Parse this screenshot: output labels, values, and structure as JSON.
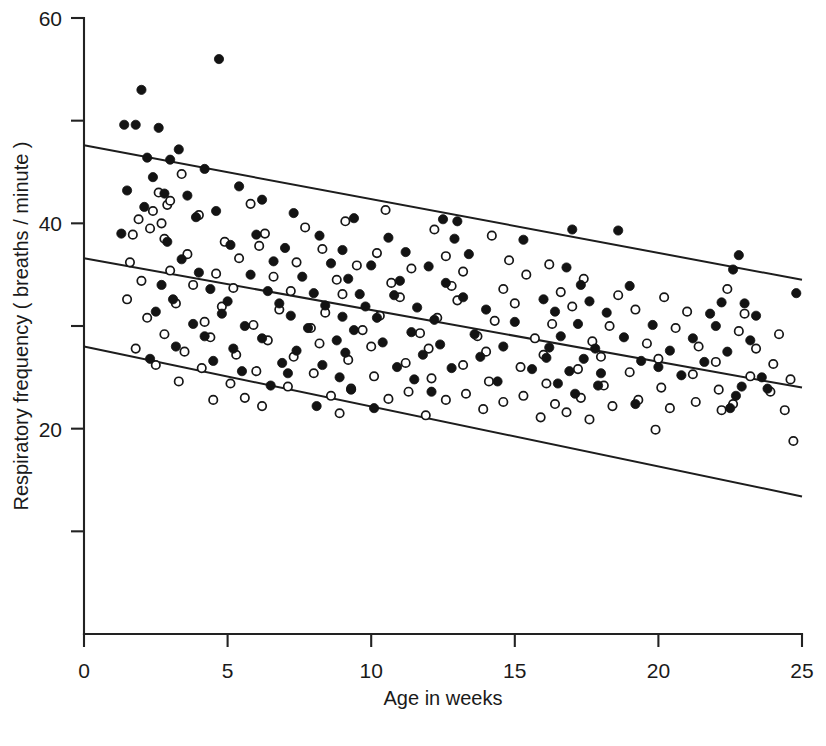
{
  "chart_data": {
    "type": "scatter",
    "title": "",
    "xlabel": "Age in weeks",
    "ylabel": "Respiratory frequency ( breaths / minute )",
    "xlim": [
      0,
      25
    ],
    "ylim": [
      0,
      60
    ],
    "grid": false,
    "legend_position": "none",
    "x_ticks": [
      0,
      5,
      10,
      15,
      20,
      25
    ],
    "x_tick_labels": [
      "0",
      "5",
      "10",
      "15",
      "20",
      "25"
    ],
    "y_ticks": [
      20,
      40,
      60
    ],
    "y_tick_labels": [
      "20",
      "40",
      "60"
    ],
    "y_minor_ticks": [
      10,
      30,
      50
    ],
    "series": [
      {
        "name": "filled-circles",
        "marker": "filled circle",
        "color": "#131313",
        "points": [
          [
            4.7,
            56.0
          ],
          [
            2.0,
            53.0
          ],
          [
            1.4,
            49.6
          ],
          [
            1.8,
            49.6
          ],
          [
            2.6,
            49.3
          ],
          [
            3.3,
            47.2
          ],
          [
            2.2,
            46.4
          ],
          [
            3.0,
            46.2
          ],
          [
            4.2,
            45.3
          ],
          [
            2.4,
            44.5
          ],
          [
            5.4,
            43.6
          ],
          [
            1.5,
            43.2
          ],
          [
            2.8,
            42.9
          ],
          [
            3.6,
            42.7
          ],
          [
            6.2,
            42.3
          ],
          [
            2.1,
            41.6
          ],
          [
            4.6,
            41.2
          ],
          [
            7.3,
            41.0
          ],
          [
            3.9,
            40.6
          ],
          [
            9.4,
            40.5
          ],
          [
            12.5,
            40.4
          ],
          [
            13.0,
            40.2
          ],
          [
            17.0,
            39.4
          ],
          [
            18.6,
            39.3
          ],
          [
            1.3,
            39.0
          ],
          [
            6.0,
            38.9
          ],
          [
            8.2,
            38.8
          ],
          [
            10.6,
            38.6
          ],
          [
            12.9,
            38.5
          ],
          [
            15.3,
            38.4
          ],
          [
            2.9,
            38.2
          ],
          [
            5.1,
            37.9
          ],
          [
            7.0,
            37.6
          ],
          [
            9.0,
            37.4
          ],
          [
            11.2,
            37.2
          ],
          [
            13.4,
            37.0
          ],
          [
            22.8,
            36.9
          ],
          [
            3.4,
            36.5
          ],
          [
            6.6,
            36.3
          ],
          [
            8.6,
            36.1
          ],
          [
            10.0,
            35.9
          ],
          [
            12.0,
            35.8
          ],
          [
            16.8,
            35.7
          ],
          [
            22.6,
            35.5
          ],
          [
            24.8,
            33.2
          ],
          [
            4.0,
            35.2
          ],
          [
            5.8,
            35.0
          ],
          [
            7.6,
            34.8
          ],
          [
            9.2,
            34.6
          ],
          [
            11.0,
            34.4
          ],
          [
            12.6,
            34.2
          ],
          [
            17.3,
            34.0
          ],
          [
            19.0,
            33.9
          ],
          [
            2.7,
            34.0
          ],
          [
            4.4,
            33.6
          ],
          [
            6.4,
            33.4
          ],
          [
            8.0,
            33.2
          ],
          [
            9.6,
            33.1
          ],
          [
            10.8,
            33.0
          ],
          [
            13.2,
            32.8
          ],
          [
            16.0,
            32.6
          ],
          [
            17.6,
            32.4
          ],
          [
            22.2,
            32.3
          ],
          [
            23.0,
            32.2
          ],
          [
            3.1,
            32.6
          ],
          [
            5.0,
            32.4
          ],
          [
            6.8,
            32.2
          ],
          [
            8.4,
            32.0
          ],
          [
            9.8,
            31.9
          ],
          [
            11.6,
            31.8
          ],
          [
            14.0,
            31.6
          ],
          [
            16.4,
            31.4
          ],
          [
            18.2,
            31.3
          ],
          [
            21.8,
            31.2
          ],
          [
            23.4,
            31.0
          ],
          [
            2.5,
            31.4
          ],
          [
            4.8,
            31.2
          ],
          [
            7.2,
            31.0
          ],
          [
            9.0,
            30.9
          ],
          [
            10.2,
            30.8
          ],
          [
            12.2,
            30.6
          ],
          [
            15.0,
            30.4
          ],
          [
            17.2,
            30.2
          ],
          [
            19.8,
            30.1
          ],
          [
            22.0,
            30.0
          ],
          [
            3.8,
            30.2
          ],
          [
            5.6,
            30.0
          ],
          [
            7.8,
            29.8
          ],
          [
            9.4,
            29.6
          ],
          [
            11.4,
            29.4
          ],
          [
            13.6,
            29.2
          ],
          [
            16.6,
            29.0
          ],
          [
            18.8,
            28.9
          ],
          [
            21.2,
            28.8
          ],
          [
            23.2,
            28.6
          ],
          [
            4.2,
            29.0
          ],
          [
            6.2,
            28.8
          ],
          [
            8.8,
            28.6
          ],
          [
            10.4,
            28.4
          ],
          [
            12.4,
            28.2
          ],
          [
            14.6,
            28.0
          ],
          [
            16.2,
            27.9
          ],
          [
            17.8,
            27.8
          ],
          [
            20.4,
            27.6
          ],
          [
            22.4,
            27.5
          ],
          [
            3.2,
            28.0
          ],
          [
            5.2,
            27.8
          ],
          [
            7.4,
            27.6
          ],
          [
            9.1,
            27.4
          ],
          [
            11.8,
            27.2
          ],
          [
            13.8,
            27.0
          ],
          [
            16.1,
            26.9
          ],
          [
            17.4,
            26.8
          ],
          [
            19.4,
            26.6
          ],
          [
            21.6,
            26.5
          ],
          [
            4.5,
            26.6
          ],
          [
            6.9,
            26.4
          ],
          [
            8.3,
            26.2
          ],
          [
            10.9,
            26.0
          ],
          [
            12.8,
            25.9
          ],
          [
            15.6,
            25.8
          ],
          [
            16.9,
            25.6
          ],
          [
            18.0,
            25.4
          ],
          [
            20.8,
            25.2
          ],
          [
            23.6,
            25.0
          ],
          [
            2.3,
            26.8
          ],
          [
            5.5,
            25.6
          ],
          [
            7.1,
            25.4
          ],
          [
            8.9,
            25.0
          ],
          [
            11.5,
            24.8
          ],
          [
            14.4,
            24.6
          ],
          [
            16.5,
            24.4
          ],
          [
            17.9,
            24.2
          ],
          [
            22.9,
            24.1
          ],
          [
            23.8,
            23.9
          ],
          [
            6.5,
            24.2
          ],
          [
            9.3,
            23.8
          ],
          [
            12.1,
            23.6
          ],
          [
            17.1,
            23.4
          ],
          [
            22.7,
            23.2
          ],
          [
            8.1,
            22.2
          ],
          [
            10.1,
            22.0
          ],
          [
            19.2,
            22.4
          ],
          [
            22.5,
            22.0
          ],
          [
            20.0,
            26.0
          ]
        ]
      },
      {
        "name": "open-circles",
        "marker": "open circle",
        "color": "#ffffff",
        "points": [
          [
            3.4,
            44.8
          ],
          [
            2.6,
            43.0
          ],
          [
            2.9,
            41.8
          ],
          [
            2.4,
            41.2
          ],
          [
            1.9,
            40.4
          ],
          [
            2.7,
            40.0
          ],
          [
            2.3,
            39.5
          ],
          [
            1.7,
            38.9
          ],
          [
            2.8,
            38.5
          ],
          [
            3.0,
            42.2
          ],
          [
            5.8,
            41.9
          ],
          [
            4.0,
            40.8
          ],
          [
            10.5,
            41.3
          ],
          [
            9.1,
            40.2
          ],
          [
            7.7,
            39.6
          ],
          [
            6.3,
            39.0
          ],
          [
            12.2,
            39.4
          ],
          [
            14.2,
            38.8
          ],
          [
            4.9,
            38.2
          ],
          [
            6.1,
            37.8
          ],
          [
            8.3,
            37.5
          ],
          [
            10.2,
            37.1
          ],
          [
            12.6,
            36.8
          ],
          [
            14.8,
            36.4
          ],
          [
            16.2,
            36.0
          ],
          [
            3.6,
            37.0
          ],
          [
            5.4,
            36.6
          ],
          [
            7.4,
            36.2
          ],
          [
            9.5,
            35.9
          ],
          [
            11.4,
            35.6
          ],
          [
            13.2,
            35.3
          ],
          [
            15.4,
            35.0
          ],
          [
            17.4,
            34.6
          ],
          [
            1.6,
            36.2
          ],
          [
            3.0,
            35.4
          ],
          [
            4.6,
            35.1
          ],
          [
            6.6,
            34.8
          ],
          [
            8.8,
            34.5
          ],
          [
            10.7,
            34.2
          ],
          [
            12.8,
            33.9
          ],
          [
            14.6,
            33.6
          ],
          [
            16.6,
            33.3
          ],
          [
            18.6,
            33.0
          ],
          [
            20.2,
            32.8
          ],
          [
            22.4,
            33.6
          ],
          [
            2.0,
            34.4
          ],
          [
            3.8,
            34.0
          ],
          [
            5.2,
            33.7
          ],
          [
            7.2,
            33.4
          ],
          [
            9.0,
            33.1
          ],
          [
            11.0,
            32.8
          ],
          [
            13.0,
            32.5
          ],
          [
            15.0,
            32.2
          ],
          [
            17.0,
            31.9
          ],
          [
            19.2,
            31.6
          ],
          [
            21.0,
            31.4
          ],
          [
            23.0,
            31.2
          ],
          [
            1.5,
            32.6
          ],
          [
            3.2,
            32.2
          ],
          [
            4.8,
            31.9
          ],
          [
            6.8,
            31.6
          ],
          [
            8.4,
            31.3
          ],
          [
            10.3,
            31.0
          ],
          [
            12.3,
            30.8
          ],
          [
            14.3,
            30.5
          ],
          [
            16.3,
            30.2
          ],
          [
            18.3,
            30.0
          ],
          [
            20.6,
            29.8
          ],
          [
            22.8,
            29.5
          ],
          [
            24.2,
            29.2
          ],
          [
            2.2,
            30.8
          ],
          [
            4.2,
            30.4
          ],
          [
            5.9,
            30.1
          ],
          [
            7.9,
            29.8
          ],
          [
            9.7,
            29.6
          ],
          [
            11.7,
            29.3
          ],
          [
            13.7,
            29.0
          ],
          [
            15.7,
            28.8
          ],
          [
            17.7,
            28.5
          ],
          [
            19.6,
            28.3
          ],
          [
            21.4,
            28.0
          ],
          [
            23.4,
            27.8
          ],
          [
            2.8,
            29.2
          ],
          [
            4.4,
            28.9
          ],
          [
            6.4,
            28.6
          ],
          [
            8.2,
            28.3
          ],
          [
            10.0,
            28.0
          ],
          [
            12.0,
            27.8
          ],
          [
            14.0,
            27.5
          ],
          [
            16.0,
            27.2
          ],
          [
            18.0,
            27.0
          ],
          [
            20.0,
            26.8
          ],
          [
            22.0,
            26.5
          ],
          [
            24.0,
            26.3
          ],
          [
            1.8,
            27.8
          ],
          [
            3.5,
            27.5
          ],
          [
            5.3,
            27.2
          ],
          [
            7.3,
            27.0
          ],
          [
            9.2,
            26.7
          ],
          [
            11.2,
            26.4
          ],
          [
            13.2,
            26.2
          ],
          [
            15.2,
            26.0
          ],
          [
            17.2,
            25.8
          ],
          [
            19.0,
            25.5
          ],
          [
            21.2,
            25.3
          ],
          [
            23.2,
            25.1
          ],
          [
            24.6,
            24.8
          ],
          [
            2.5,
            26.2
          ],
          [
            4.1,
            25.9
          ],
          [
            6.0,
            25.6
          ],
          [
            8.0,
            25.4
          ],
          [
            10.1,
            25.1
          ],
          [
            12.1,
            24.9
          ],
          [
            14.1,
            24.6
          ],
          [
            16.1,
            24.4
          ],
          [
            18.1,
            24.2
          ],
          [
            20.1,
            24.0
          ],
          [
            22.1,
            23.8
          ],
          [
            23.9,
            23.6
          ],
          [
            3.3,
            24.6
          ],
          [
            5.1,
            24.4
          ],
          [
            7.1,
            24.1
          ],
          [
            9.3,
            23.9
          ],
          [
            11.3,
            23.6
          ],
          [
            13.3,
            23.4
          ],
          [
            15.3,
            23.2
          ],
          [
            17.3,
            23.0
          ],
          [
            19.3,
            22.8
          ],
          [
            21.3,
            22.6
          ],
          [
            22.6,
            22.4
          ],
          [
            6.2,
            22.2
          ],
          [
            8.6,
            23.2
          ],
          [
            10.6,
            22.9
          ],
          [
            12.6,
            22.8
          ],
          [
            14.6,
            22.6
          ],
          [
            16.4,
            22.4
          ],
          [
            18.4,
            22.2
          ],
          [
            20.4,
            22.0
          ],
          [
            22.2,
            21.8
          ],
          [
            24.4,
            21.8
          ],
          [
            8.9,
            21.5
          ],
          [
            11.9,
            21.3
          ],
          [
            15.9,
            21.1
          ],
          [
            17.6,
            20.9
          ],
          [
            19.9,
            19.9
          ],
          [
            24.7,
            18.8
          ],
          [
            16.8,
            21.6
          ],
          [
            5.6,
            23.0
          ],
          [
            4.5,
            22.8
          ],
          [
            13.9,
            21.9
          ]
        ]
      }
    ],
    "lines": [
      {
        "name": "upper-line",
        "x": [
          0,
          25
        ],
        "y": [
          47.6,
          34.5
        ]
      },
      {
        "name": "regression-line",
        "x": [
          0,
          25
        ],
        "y": [
          36.6,
          24.0
        ]
      },
      {
        "name": "lower-line",
        "x": [
          0,
          25
        ],
        "y": [
          28.0,
          13.4
        ]
      }
    ]
  }
}
